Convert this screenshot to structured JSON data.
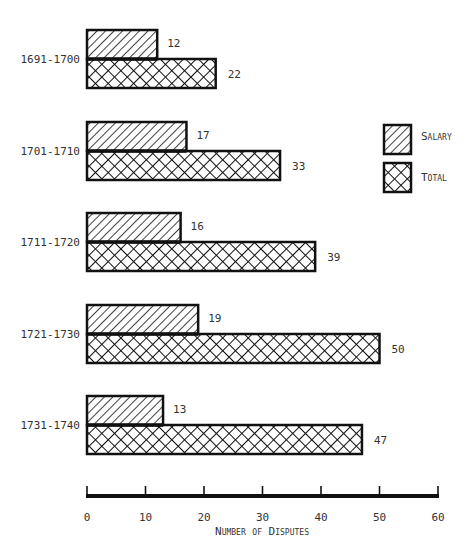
{
  "chart_data": {
    "type": "bar",
    "orientation": "horizontal",
    "title": "",
    "xlabel": "Number of Disputes",
    "ylabel": "",
    "xlim": [
      0,
      60
    ],
    "xticks": [
      0,
      10,
      20,
      30,
      40,
      50,
      60
    ],
    "grid": false,
    "legend_position": "right",
    "categories": [
      "1691-1700",
      "1701-1710",
      "1711-1720",
      "1721-1730",
      "1731-1740"
    ],
    "series": [
      {
        "name": "Salary",
        "pattern": "diagonal-hatch",
        "values": [
          12,
          17,
          16,
          19,
          13
        ]
      },
      {
        "name": "Total",
        "pattern": "cross-hatch",
        "values": [
          22,
          33,
          39,
          50,
          47
        ]
      }
    ]
  },
  "legend": {
    "salary": "Salary",
    "total": "Total"
  },
  "axis": {
    "xlabel": "Number of Disputes"
  }
}
